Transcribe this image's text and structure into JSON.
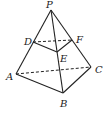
{
  "figure": {
    "type": "tetrahedron (triangular pyramid) with cross-section DEF",
    "points": {
      "P": {
        "label": "P",
        "x": 51,
        "y": 10
      },
      "A": {
        "label": "A",
        "x": 16,
        "y": 74
      },
      "B": {
        "label": "B",
        "x": 63,
        "y": 93
      },
      "C": {
        "label": "C",
        "x": 91,
        "y": 67
      },
      "D": {
        "label": "D",
        "x": 33,
        "y": 42
      },
      "E": {
        "label": "E",
        "x": 57,
        "y": 52
      },
      "F": {
        "label": "F",
        "x": 72,
        "y": 40
      }
    },
    "solid_edges": [
      "PA",
      "PB",
      "PC",
      "AB",
      "BC",
      "DE",
      "EF"
    ],
    "dashed_edges": [
      "AC",
      "DF"
    ]
  }
}
